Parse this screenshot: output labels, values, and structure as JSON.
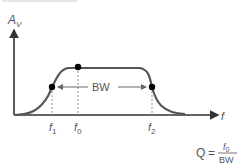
{
  "top_clip_text": "",
  "axes": {
    "y_label": "A",
    "y_label_sub": "V",
    "x_label": "f"
  },
  "markers": {
    "f1": {
      "base": "f",
      "sub": "1"
    },
    "f0": {
      "base": "f",
      "sub": "0"
    },
    "f2": {
      "base": "f",
      "sub": "2"
    }
  },
  "bandwidth_label": "BW",
  "formula": {
    "lhs": "Q",
    "equals": "=",
    "numerator_base": "f",
    "numerator_sub": "0",
    "denominator": "BW"
  },
  "colors": {
    "curve": "#555555",
    "axis": "#333333",
    "dot": "#000000",
    "text": "#555555"
  }
}
